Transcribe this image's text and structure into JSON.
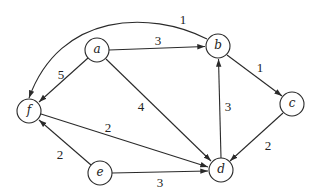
{
  "diagram": {
    "type": "directed-weighted-graph",
    "nodes": [
      {
        "id": "a",
        "label": "a",
        "x": 97,
        "y": 50
      },
      {
        "id": "b",
        "label": "b",
        "x": 218,
        "y": 46
      },
      {
        "id": "c",
        "label": "c",
        "x": 292,
        "y": 104
      },
      {
        "id": "d",
        "label": "d",
        "x": 221,
        "y": 170
      },
      {
        "id": "e",
        "label": "e",
        "x": 100,
        "y": 173
      },
      {
        "id": "f",
        "label": "f",
        "x": 29,
        "y": 111
      }
    ],
    "edges": [
      {
        "from": "a",
        "to": "b",
        "weight": "3"
      },
      {
        "from": "a",
        "to": "f",
        "weight": "5"
      },
      {
        "from": "a",
        "to": "d",
        "weight": "4"
      },
      {
        "from": "b",
        "to": "f",
        "weight": "1",
        "curved": true
      },
      {
        "from": "b",
        "to": "c",
        "weight": "1"
      },
      {
        "from": "c",
        "to": "d",
        "weight": "2"
      },
      {
        "from": "d",
        "to": "b",
        "weight": "3"
      },
      {
        "from": "f",
        "to": "d",
        "weight": "2"
      },
      {
        "from": "e",
        "to": "f",
        "weight": "2"
      },
      {
        "from": "e",
        "to": "d",
        "weight": "3"
      }
    ]
  }
}
